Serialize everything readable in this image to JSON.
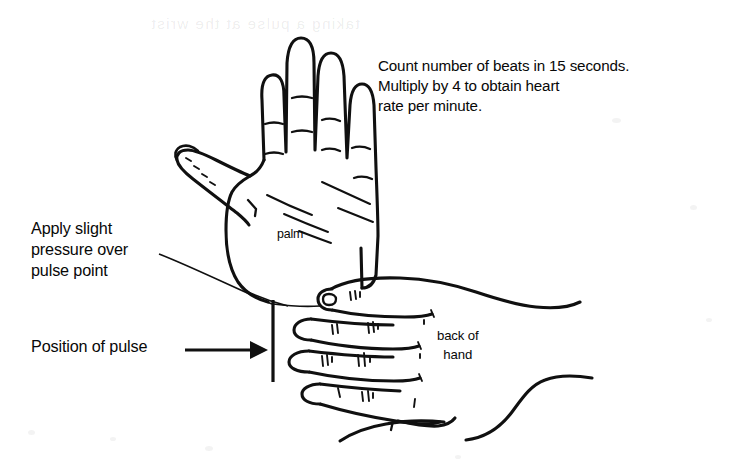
{
  "figure": {
    "title": "Taking a pulse at the wrist",
    "background_color": "#ffffff",
    "ink_color": "#101010"
  },
  "annotations": {
    "instruction_text": "Count number of beats in 15 seconds.\nMultiply by 4 to obtain heart\nrate per minute.",
    "instruction_lines": [
      "Count number of beats in 15 seconds.",
      "Multiply by 4 to obtain heart",
      "rate per minute."
    ],
    "apply_pressure_label": "Apply slight\npressure over\npulse point",
    "apply_pressure_lines": [
      "Apply slight",
      "pressure over",
      "pulse point"
    ],
    "position_of_pulse_label": "Position of pulse",
    "palm_label": "palm",
    "back_of_hand_label": "back of\nhand",
    "back_of_hand_lines": [
      "back of",
      "hand"
    ],
    "ghost_text_top": "taking a pulse at the wrist"
  },
  "callouts": [
    {
      "name": "apply-slight-pressure",
      "text": "Apply slight pressure over pulse point",
      "marker": "leader-line",
      "points_to": "wrist pulse point"
    },
    {
      "name": "position-of-pulse",
      "text": "Position of pulse",
      "marker": "arrow",
      "points_to": "wrist pulse point"
    },
    {
      "name": "palm",
      "text": "palm",
      "marker": "none",
      "points_to": "upper hand palm surface"
    },
    {
      "name": "back-of-hand",
      "text": "back of hand",
      "marker": "none",
      "points_to": "lower hand dorsal surface"
    }
  ]
}
